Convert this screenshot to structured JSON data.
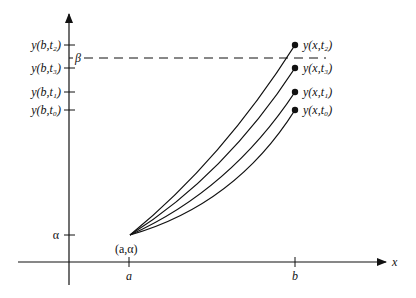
{
  "diagram": {
    "axes": {
      "x_label": "x",
      "origin_px": [
        69,
        262
      ]
    },
    "x_ticks": [
      {
        "label": "a",
        "px": 129
      },
      {
        "label": "b",
        "px": 295
      }
    ],
    "y_ticks": [
      {
        "label": "y(b,t₂)",
        "px": 45
      },
      {
        "label": "y(b,t₃)",
        "px": 68
      },
      {
        "label": "y(b,t₁)",
        "px": 92
      },
      {
        "label": "y(b,t₀)",
        "px": 110
      },
      {
        "label": "α",
        "px": 235
      }
    ],
    "target_line": {
      "label": "β",
      "px": 58,
      "style": "dashed"
    },
    "start_point": {
      "label": "(a,α)",
      "px": [
        130,
        235
      ]
    },
    "curves": [
      {
        "label": "y(x,t₂)",
        "end_px": [
          295,
          45
        ]
      },
      {
        "label": "y(x,t₃)",
        "end_px": [
          295,
          68
        ]
      },
      {
        "label": "y(x,t₁)",
        "end_px": [
          295,
          92
        ]
      },
      {
        "label": "y(x,t₀)",
        "end_px": [
          295,
          110
        ]
      }
    ],
    "colors": {
      "ink": "#111111",
      "background": "#ffffff"
    }
  }
}
